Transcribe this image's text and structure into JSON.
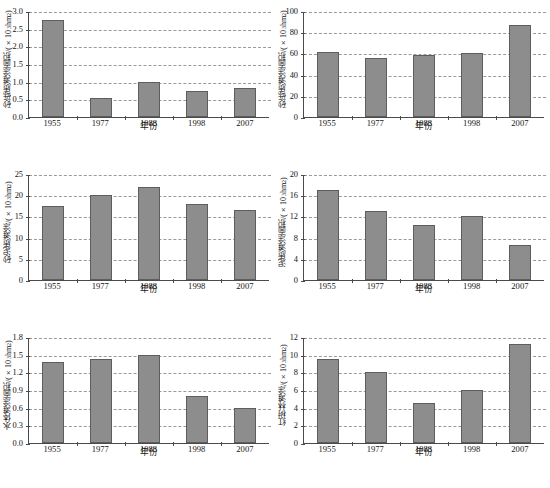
{
  "figure": {
    "layout": "2 columns x 3 rows of small-multiple bar charts",
    "bar_color": "#8d8d8d",
    "bar_border_color": "#5d5d5d",
    "gridline_color": "#9a9a9a",
    "axis_color": "#4a4a4a",
    "background": "#ffffff"
  },
  "chart_data": [
    {
      "type": "bar",
      "title": "",
      "xlabel": "年份",
      "ylabel": "砂砾质滩涂面积/(×10³ hm²)",
      "ylabel_base": "砂砾质滩涂面积/(×10",
      "ylabel_exp": "3",
      "ylabel_tail": " hm",
      "ylabel_tail_exp": "2",
      "ylabel_close": ")",
      "categories": [
        "1955",
        "1977",
        "1988",
        "1998",
        "2007"
      ],
      "values": [
        2.75,
        0.55,
        1.0,
        0.75,
        0.82
      ],
      "yticks": [
        "3.0",
        "2.5",
        "2.0",
        "1.5",
        "1.0",
        "0.5",
        "0.0"
      ],
      "ytick_values": [
        3.0,
        2.5,
        2.0,
        1.5,
        1.0,
        0.5,
        0.0
      ],
      "ylim": [
        0,
        3.0
      ],
      "grid": true,
      "legend": "none"
    },
    {
      "type": "bar",
      "title": "",
      "xlabel": "年份",
      "ylabel": "砂砾质滩涂面积/(×10³ hm²)",
      "ylabel_base": "砂砾质滩涂面积/(×10",
      "ylabel_exp": "3",
      "ylabel_tail": " hm",
      "ylabel_tail_exp": "2",
      "ylabel_close": ")",
      "categories": [
        "1955",
        "1977",
        "1988",
        "1998",
        "2007"
      ],
      "values": [
        61,
        55.5,
        58.5,
        60.5,
        87
      ],
      "yticks": [
        "100",
        "80",
        "60",
        "40",
        "20",
        "0"
      ],
      "ytick_values": [
        100,
        80,
        60,
        40,
        20,
        0
      ],
      "ylim": [
        0,
        100
      ],
      "grid": true,
      "legend": "none"
    },
    {
      "type": "bar",
      "title": "",
      "xlabel": "年份",
      "ylabel": "砂泥质滩涂/(×10³ hm²)",
      "ylabel_base": "砂泥质滩涂/(×10",
      "ylabel_exp": "3",
      "ylabel_tail": " hm",
      "ylabel_tail_exp": "2",
      "ylabel_close": ")",
      "categories": [
        "1955",
        "1977",
        "1988",
        "1998",
        "2007"
      ],
      "values": [
        17.5,
        20.0,
        22.0,
        18.0,
        16.5
      ],
      "yticks": [
        "25",
        "20",
        "15",
        "10",
        "5",
        "0"
      ],
      "ytick_values": [
        25,
        20,
        15,
        10,
        5,
        0
      ],
      "ylim": [
        0,
        25
      ],
      "grid": true,
      "legend": "none"
    },
    {
      "type": "bar",
      "title": "",
      "xlabel": "年份",
      "ylabel": "泥质滩涂面积/(×10³ hm²)",
      "ylabel_base": "泥质滩涂面积/(×10",
      "ylabel_exp": "3",
      "ylabel_tail": " hm",
      "ylabel_tail_exp": "2",
      "ylabel_close": ")",
      "categories": [
        "1955",
        "1977",
        "1988",
        "1998",
        "2007"
      ],
      "values": [
        17.0,
        13.0,
        10.4,
        12.0,
        6.6
      ],
      "yticks": [
        "20",
        "16",
        "12",
        "8",
        "4",
        "0"
      ],
      "ytick_values": [
        20,
        16,
        12,
        8,
        4,
        0
      ],
      "ylim": [
        0,
        20
      ],
      "grid": true,
      "legend": "none"
    },
    {
      "type": "bar",
      "title": "",
      "xlabel": "年份",
      "ylabel": "水体滩涂面积/(×10³ hm²)",
      "ylabel_base": "水体滩涂面积/(×10",
      "ylabel_exp": "3",
      "ylabel_tail": " hm",
      "ylabel_tail_exp": "2",
      "ylabel_close": ")",
      "categories": [
        "1955",
        "1977",
        "1988",
        "1998",
        "2007"
      ],
      "values": [
        1.38,
        1.43,
        1.5,
        0.8,
        0.59
      ],
      "yticks": [
        "1.8",
        "1.5",
        "1.2",
        "0.9",
        "0.6",
        "0.3",
        "0.0"
      ],
      "ytick_values": [
        1.8,
        1.5,
        1.2,
        0.9,
        0.6,
        0.3,
        0.0
      ],
      "ylim": [
        0,
        1.8
      ],
      "grid": true,
      "legend": "none"
    },
    {
      "type": "bar",
      "title": "",
      "xlabel": "年份",
      "ylabel": "红树林滩涂/(×10³ hm²)",
      "ylabel_base": "红树林滩涂/(×10",
      "ylabel_exp": "3",
      "ylabel_tail": " hm",
      "ylabel_tail_exp": "2",
      "ylabel_close": ")",
      "categories": [
        "1955",
        "1977",
        "1988",
        "1998",
        "2007"
      ],
      "values": [
        9.5,
        8.0,
        4.5,
        6.0,
        11.2
      ],
      "yticks": [
        "12",
        "10",
        "8",
        "6",
        "4",
        "2",
        "0"
      ],
      "ytick_values": [
        12,
        10,
        8,
        6,
        4,
        2,
        0
      ],
      "ylim": [
        0,
        12
      ],
      "grid": true,
      "legend": "none"
    }
  ]
}
